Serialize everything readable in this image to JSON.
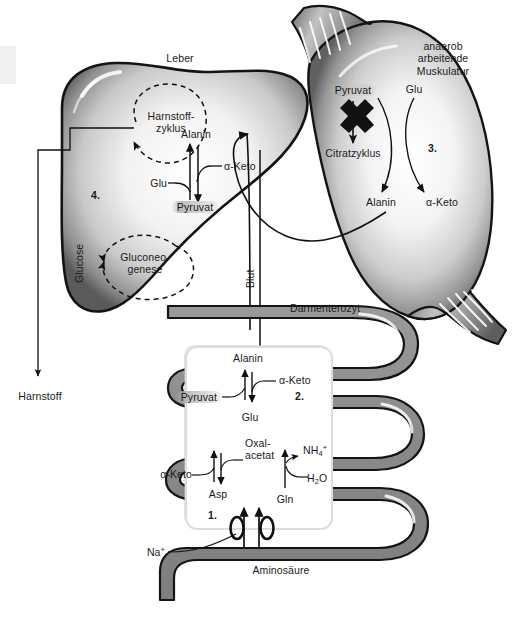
{
  "figure": {
    "colors": {
      "organ_dark": "#1a1a1a",
      "organ_mid": "#8c8c8c",
      "organ_light": "#ffffff",
      "intestine_fill": "#8a8a8a",
      "enterocyte_fill": "#ffffff",
      "text": "#1a1a1a",
      "corner_swatch": "#f0f0f0"
    }
  },
  "liver": {
    "title": "Leber",
    "step_number": "4.",
    "urea_cycle": "Harnstoff-\nzyklus",
    "gluconeogenesis": "Gluconeo-\ngenese",
    "glucose": "Glucose",
    "alanin": "Alanin",
    "pyruvat": "Pyruvat",
    "glu": "Glu",
    "alpha_keto": "α-Keto"
  },
  "muscle": {
    "title": "anaerob arbeitende\nMuskulatur",
    "step_number": "3.",
    "pyruvat": "Pyruvat",
    "citratzyklus": "Citratzyklus",
    "glu": "Glu",
    "alanin": "Alanin",
    "alpha_keto": "α-Keto",
    "block_symbol": "X"
  },
  "blood": {
    "label": "Blut"
  },
  "urea_output": {
    "label": "Harnstoff"
  },
  "enterocyte": {
    "title": "Darmenterozyt",
    "step_number_upper": "2.",
    "step_number_lower": "1.",
    "alanin": "Alanin",
    "alpha_keto_upper": "α-Keto",
    "pyruvat": "Pyruvat",
    "glu": "Glu",
    "alpha_keto_lower": "α-Keto",
    "oxalacetat": "Oxal-\nacetat",
    "asp": "Asp",
    "gln": "Gln",
    "h2o": {
      "text": "H",
      "sub": "2",
      "tail": "O"
    },
    "nh4": {
      "text": "NH",
      "sub": "4",
      "sup": "+"
    },
    "aminosaeure": "Aminosäure",
    "na_ion": {
      "text": "Na",
      "sup": "+"
    },
    "transporters": [
      "transporter-left",
      "transporter-right"
    ]
  }
}
